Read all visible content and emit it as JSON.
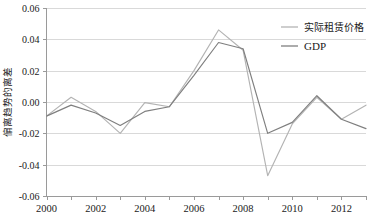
{
  "chart_data": {
    "type": "line",
    "title": "",
    "xlabel": "",
    "ylabel": "偏离趋势的离差",
    "ylim": [
      -0.06,
      0.06
    ],
    "xlim": [
      2000,
      2013
    ],
    "grid": true,
    "legend_position": "top-right",
    "y_ticks": [
      "0.06",
      "0.04",
      "0.02",
      "0.00",
      "-0.02",
      "-0.04",
      "-0.06"
    ],
    "y_tick_values": [
      0.06,
      0.04,
      0.02,
      0.0,
      -0.02,
      -0.04,
      -0.06
    ],
    "x": [
      2000,
      2001,
      2002,
      2003,
      2004,
      2005,
      2006,
      2007,
      2008,
      2009,
      2010,
      2011,
      2012,
      2013
    ],
    "x_tick_labels": [
      "2000",
      "2002",
      "2004",
      "2006",
      "2008",
      "2010",
      "2012"
    ],
    "x_tick_label_values": [
      2000,
      2002,
      2004,
      2006,
      2008,
      2010,
      2012
    ],
    "series": [
      {
        "name": "实际租赁价格",
        "color": "#b3b3b3",
        "values": [
          -0.009,
          0.003,
          -0.006,
          -0.02,
          -0.0004,
          -0.003,
          0.02,
          0.046,
          0.033,
          -0.047,
          -0.014,
          0.003,
          -0.011,
          -0.002
        ]
      },
      {
        "name": "GDP",
        "color": "#7f7f7f",
        "values": [
          -0.009,
          -0.002,
          -0.007,
          -0.015,
          -0.006,
          -0.003,
          0.017,
          0.038,
          0.034,
          -0.02,
          -0.013,
          0.004,
          -0.011,
          -0.017
        ]
      }
    ]
  },
  "legend": {
    "items": [
      {
        "label": "实际租赁价格",
        "color": "#b3b3b3"
      },
      {
        "label": "GDP",
        "color": "#7f7f7f"
      }
    ]
  }
}
